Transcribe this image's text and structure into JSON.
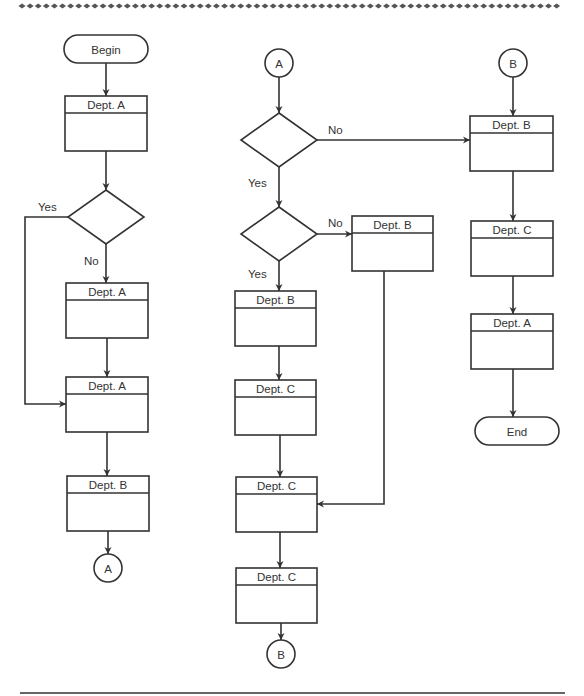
{
  "diagram": {
    "type": "cross-functional flowchart",
    "colors": {
      "stroke": "#333333",
      "background": "#ffffff"
    },
    "terminals": [
      {
        "id": "begin",
        "label": "Begin",
        "x": 64,
        "y": 35,
        "w": 84,
        "h": 28
      },
      {
        "id": "end",
        "label": "End",
        "x": 475,
        "y": 417,
        "w": 84,
        "h": 28
      }
    ],
    "connectors": [
      {
        "id": "conn-a-out",
        "label": "A",
        "cx": 108,
        "cy": 568,
        "r": 14
      },
      {
        "id": "conn-a-in",
        "label": "A",
        "cx": 279,
        "cy": 63,
        "r": 14
      },
      {
        "id": "conn-b-out",
        "label": "B",
        "cx": 281,
        "cy": 654,
        "r": 14
      },
      {
        "id": "conn-b-in",
        "label": "B",
        "cx": 513,
        "cy": 63,
        "r": 14
      }
    ],
    "process_boxes": [
      {
        "id": "p1",
        "label": "Dept. A",
        "x": 65,
        "y": 96,
        "w": 82,
        "h": 55
      },
      {
        "id": "p2",
        "label": "Dept. A",
        "x": 66,
        "y": 283,
        "w": 82,
        "h": 55
      },
      {
        "id": "p3",
        "label": "Dept. A",
        "x": 66,
        "y": 377,
        "w": 82,
        "h": 55
      },
      {
        "id": "p4",
        "label": "Dept. B",
        "x": 67,
        "y": 476,
        "w": 82,
        "h": 55
      },
      {
        "id": "p5",
        "label": "Dept. B",
        "x": 352,
        "y": 216,
        "w": 81,
        "h": 55
      },
      {
        "id": "p6",
        "label": "Dept. B",
        "x": 235,
        "y": 291,
        "w": 81,
        "h": 55
      },
      {
        "id": "p7",
        "label": "Dept. C",
        "x": 235,
        "y": 380,
        "w": 81,
        "h": 55
      },
      {
        "id": "p8",
        "label": "Dept. C",
        "x": 236,
        "y": 477,
        "w": 81,
        "h": 55
      },
      {
        "id": "p9",
        "label": "Dept. C",
        "x": 236,
        "y": 568,
        "w": 81,
        "h": 55
      },
      {
        "id": "p10",
        "label": "Dept. B",
        "x": 470,
        "y": 116,
        "w": 83,
        "h": 55
      },
      {
        "id": "p11",
        "label": "Dept. C",
        "x": 471,
        "y": 221,
        "w": 82,
        "h": 55
      },
      {
        "id": "p12",
        "label": "Dept. A",
        "x": 471,
        "y": 314,
        "w": 82,
        "h": 55
      }
    ],
    "decisions": [
      {
        "id": "d1",
        "cx": 106,
        "cy": 217,
        "hw": 38,
        "hh": 27
      },
      {
        "id": "d2",
        "cx": 279,
        "cy": 140,
        "hw": 38,
        "hh": 27
      },
      {
        "id": "d3",
        "cx": 279,
        "cy": 234,
        "hw": 38,
        "hh": 27
      }
    ],
    "branch_labels": [
      {
        "id": "d1-yes",
        "text": "Yes",
        "x": 38,
        "y": 211
      },
      {
        "id": "d1-no",
        "text": "No",
        "x": 84,
        "y": 265
      },
      {
        "id": "d2-no",
        "text": "No",
        "x": 328,
        "y": 134
      },
      {
        "id": "d2-yes",
        "text": "Yes",
        "x": 248,
        "y": 187
      },
      {
        "id": "d3-no",
        "text": "No",
        "x": 328,
        "y": 227
      },
      {
        "id": "d3-yes",
        "text": "Yes",
        "x": 248,
        "y": 278
      }
    ],
    "arrows": [
      {
        "id": "begin-p1",
        "points": [
          [
            106,
            63
          ],
          [
            106,
            96
          ]
        ],
        "head": true
      },
      {
        "id": "p1-d1",
        "points": [
          [
            106,
            151
          ],
          [
            106,
            190
          ]
        ],
        "head": true
      },
      {
        "id": "d1-p2",
        "points": [
          [
            106,
            244
          ],
          [
            106,
            283
          ]
        ],
        "head": true
      },
      {
        "id": "d1-yes-loop",
        "points": [
          [
            68,
            217
          ],
          [
            25,
            217
          ],
          [
            25,
            404
          ],
          [
            66,
            404
          ]
        ],
        "head": true
      },
      {
        "id": "p2-p3",
        "points": [
          [
            107,
            338
          ],
          [
            107,
            377
          ]
        ],
        "head": true
      },
      {
        "id": "p3-p4",
        "points": [
          [
            107,
            432
          ],
          [
            107,
            476
          ]
        ],
        "head": true
      },
      {
        "id": "p4-connA",
        "points": [
          [
            108,
            531
          ],
          [
            108,
            554
          ]
        ],
        "head": true
      },
      {
        "id": "connA-d2",
        "points": [
          [
            279,
            77
          ],
          [
            279,
            113
          ]
        ],
        "head": true
      },
      {
        "id": "d2-no-p10",
        "points": [
          [
            317,
            140
          ],
          [
            470,
            140
          ]
        ],
        "head": true
      },
      {
        "id": "d2-yes-d3",
        "points": [
          [
            279,
            167
          ],
          [
            279,
            207
          ]
        ],
        "head": true
      },
      {
        "id": "d3-no-p5",
        "points": [
          [
            317,
            234
          ],
          [
            352,
            234
          ]
        ],
        "head": true
      },
      {
        "id": "d3-yes-p6",
        "points": [
          [
            279,
            261
          ],
          [
            279,
            291
          ]
        ],
        "head": true
      },
      {
        "id": "p6-p7",
        "points": [
          [
            279,
            346
          ],
          [
            279,
            380
          ]
        ],
        "head": true
      },
      {
        "id": "p7-p8",
        "points": [
          [
            280,
            435
          ],
          [
            280,
            477
          ]
        ],
        "head": true
      },
      {
        "id": "p5-p8",
        "points": [
          [
            384,
            271
          ],
          [
            384,
            504
          ],
          [
            317,
            504
          ]
        ],
        "head": true
      },
      {
        "id": "p8-p9",
        "points": [
          [
            280,
            532
          ],
          [
            280,
            568
          ]
        ],
        "head": true
      },
      {
        "id": "p9-connB",
        "points": [
          [
            281,
            623
          ],
          [
            281,
            640
          ]
        ],
        "head": true
      },
      {
        "id": "connB-p10",
        "points": [
          [
            513,
            77
          ],
          [
            513,
            116
          ]
        ],
        "head": true
      },
      {
        "id": "p10-p11",
        "points": [
          [
            513,
            171
          ],
          [
            513,
            221
          ]
        ],
        "head": true
      },
      {
        "id": "p11-p12",
        "points": [
          [
            513,
            276
          ],
          [
            513,
            314
          ]
        ],
        "head": true
      },
      {
        "id": "p12-end",
        "points": [
          [
            513,
            369
          ],
          [
            513,
            417
          ]
        ],
        "head": true
      }
    ],
    "header_height": 17,
    "top_border": {
      "y": 6,
      "x_start": 22,
      "x_end": 562,
      "spacing": 8.1
    },
    "bottom_rule": {
      "y": 693,
      "x_start": 20,
      "x_end": 565
    }
  }
}
